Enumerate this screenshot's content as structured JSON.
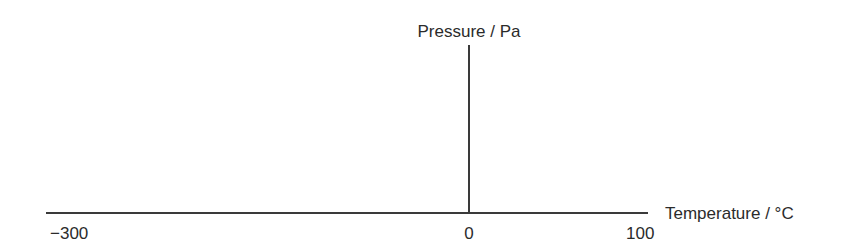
{
  "chart_data": {
    "type": "line",
    "title": "",
    "xlabel": "Temperature / °C",
    "ylabel": "Pressure / Pa",
    "x_ticks": [
      "-300",
      "0",
      "100"
    ],
    "xlim": [
      -300,
      100
    ],
    "ylim": [
      0,
      null
    ],
    "grid": false,
    "series": []
  },
  "labels": {
    "y_axis": "Pressure / Pa",
    "x_axis": "Temperature / °C",
    "tick_min": "−300",
    "tick_zero": "0",
    "tick_max": "100"
  }
}
